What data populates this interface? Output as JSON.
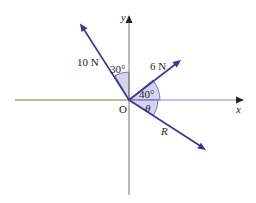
{
  "colors": {
    "vector": "#3a3590",
    "axis": "#777777",
    "x_axis_left": "#6b7a3a",
    "x_axis_right": "#8a86e0",
    "sector_fill": "#d6d4f0",
    "sector_stroke": "#5a56a8",
    "text": "#222222"
  },
  "labels": {
    "y_axis": "y",
    "x_axis": "x",
    "origin": "O",
    "force_10": "10 N",
    "force_6": "6 N",
    "resultant": "R",
    "angle_30": "30°",
    "angle_40": "40°",
    "angle_theta": "θ"
  },
  "vectors": [
    {
      "name": "10 N",
      "angle_from_positive_y_toward_negative_x_deg": 30
    },
    {
      "name": "6 N",
      "angle_from_positive_x_deg": 40
    },
    {
      "name": "R",
      "angle_below_positive_x_deg": "θ"
    }
  ]
}
